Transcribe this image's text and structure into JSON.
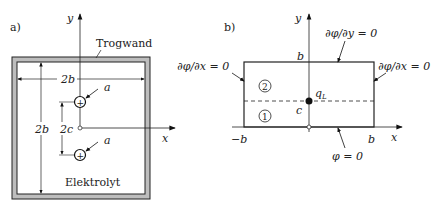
{
  "panel_a": {
    "label": "a)",
    "wall_label": "Trogwand",
    "electrolyte_label": "Elektrolyt",
    "width_label": "2b",
    "height_label": "2b",
    "spacing_label": "2c",
    "radius_label_top": "a",
    "radius_label_bottom": "a",
    "axis_x": "x",
    "axis_y": "y",
    "electrode_symbol": "+"
  },
  "panel_b": {
    "label": "b)",
    "axis_x": "x",
    "axis_y": "y",
    "top_bc": "∂φ/∂y = 0",
    "left_bc": "∂φ/∂x = 0",
    "right_bc": "∂φ/∂x = 0",
    "bottom_bc": "φ = 0",
    "top_tick": "b",
    "left_tick": "−b",
    "right_tick": "b",
    "source_label": "q",
    "source_sub": "L",
    "c_label": "c",
    "region_upper": "2",
    "region_lower": "1"
  }
}
